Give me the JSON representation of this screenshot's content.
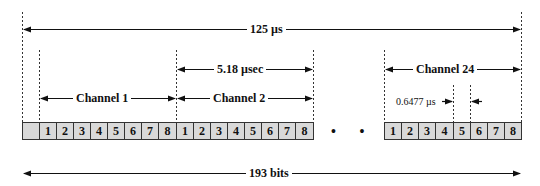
{
  "frame": {
    "duration_label": "125 µs",
    "bits_label": "193 bits",
    "channel_duration_label": "5.18 µsec",
    "bit_duration_label": "0.6477 µs"
  },
  "channels": [
    {
      "label": "Channel 1",
      "bits": [
        "1",
        "2",
        "3",
        "4",
        "5",
        "6",
        "7",
        "8"
      ]
    },
    {
      "label": "Channel 2",
      "bits": [
        "1",
        "2",
        "3",
        "4",
        "5",
        "6",
        "7",
        "8"
      ]
    },
    {
      "label": "Channel 24",
      "bits": [
        "1",
        "2",
        "3",
        "4",
        "5",
        "6",
        "7",
        "8"
      ]
    }
  ],
  "framing_bit": "",
  "ellipsis": "• • •",
  "colors": {
    "cell_fill": "#d9d9d9",
    "line": "#111111",
    "background": "#ffffff"
  }
}
